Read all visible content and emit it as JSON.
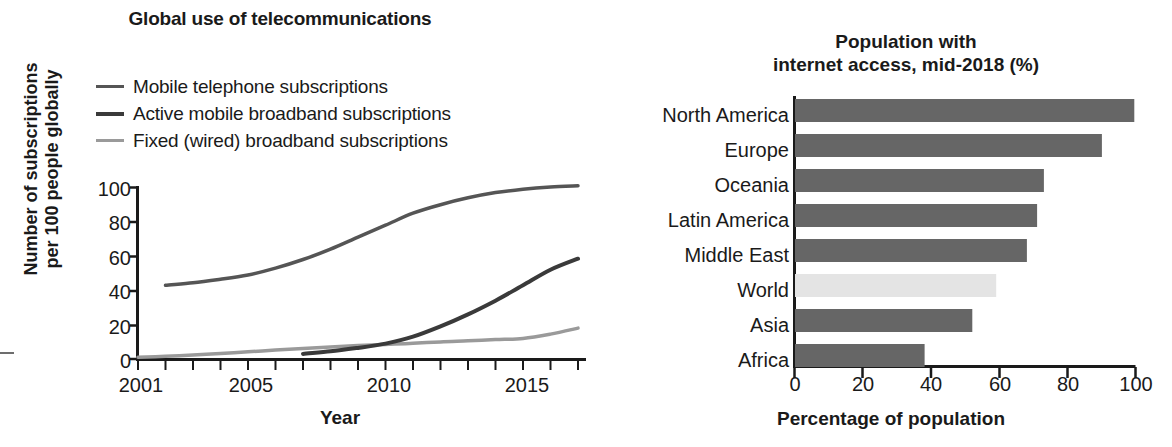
{
  "left_chart": {
    "title": "Global use of telecommunications",
    "ylabel_line1": "Number of subscriptions",
    "ylabel_line2": "per 100 people globally",
    "xlabel": "Year",
    "yticks": [
      "0",
      "20",
      "40",
      "60",
      "80",
      "100"
    ],
    "xticks": [
      "2001",
      "2005",
      "2010",
      "2015"
    ],
    "legend": [
      {
        "label": "Mobile telephone subscriptions",
        "color": "#555555",
        "width": 3
      },
      {
        "label": "Active mobile broadband subscriptions",
        "color": "#3a3a3a",
        "width": 3.5
      },
      {
        "label": "Fixed (wired) broadband subscriptions",
        "color": "#9a9a9a",
        "width": 3
      }
    ]
  },
  "right_chart": {
    "title_line1": "Population with",
    "title_line2": "internet access, mid-2018 (%)",
    "xlabel": "Percentage of population",
    "xticks": [
      "0",
      "20",
      "40",
      "60",
      "80",
      "100"
    ],
    "bar_color": "#666666",
    "highlight_color": "#e4e4e4"
  },
  "chart_data": [
    {
      "type": "line",
      "title": "Global use of telecommunications",
      "xlabel": "Year",
      "ylabel": "Number of subscriptions per 100 people globally",
      "xlim": [
        2001,
        2017
      ],
      "ylim": [
        0,
        100
      ],
      "xticks": [
        2001,
        2005,
        2010,
        2015
      ],
      "yticks": [
        0,
        20,
        40,
        60,
        80,
        100
      ],
      "grid": false,
      "legend_position": "above-plot-left",
      "series": [
        {
          "name": "Mobile telephone subscriptions",
          "color": "#555555",
          "x": [
            2002,
            2003,
            2004,
            2005,
            2006,
            2007,
            2008,
            2009,
            2010,
            2011,
            2012,
            2013,
            2014,
            2015,
            2016,
            2017
          ],
          "values": [
            43,
            44.5,
            46.5,
            49,
            53,
            58,
            64,
            71,
            78,
            85,
            90,
            94,
            97,
            99,
            100.3,
            101
          ]
        },
        {
          "name": "Active mobile broadband subscriptions",
          "color": "#3a3a3a",
          "x": [
            2007,
            2008,
            2009,
            2010,
            2011,
            2012,
            2013,
            2014,
            2015,
            2016,
            2017
          ],
          "values": [
            3,
            4.5,
            6.5,
            9,
            13,
            19,
            26,
            34,
            43,
            52,
            58.5
          ]
        },
        {
          "name": "Fixed (wired) broadband subscriptions",
          "color": "#9a9a9a",
          "x": [
            2001,
            2002,
            2003,
            2004,
            2005,
            2006,
            2007,
            2008,
            2009,
            2010,
            2011,
            2012,
            2013,
            2014,
            2015,
            2016,
            2017
          ],
          "values": [
            1,
            1.6,
            2.3,
            3.2,
            4.2,
            5.2,
            6.1,
            7.0,
            7.8,
            8.5,
            9.2,
            10.0,
            10.6,
            11.3,
            12.0,
            14.5,
            18
          ]
        }
      ]
    },
    {
      "type": "bar",
      "orientation": "horizontal",
      "title": "Population with internet access, mid-2018 (%)",
      "xlabel": "Percentage of population",
      "ylabel": "",
      "xlim": [
        0,
        100
      ],
      "xticks": [
        0,
        20,
        40,
        60,
        80,
        100
      ],
      "grid": false,
      "categories": [
        "North America",
        "Europe",
        "Oceania",
        "Latin America",
        "Middle East",
        "World",
        "Asia",
        "Africa"
      ],
      "values": [
        99.5,
        90,
        73,
        71,
        68,
        59,
        52,
        38
      ],
      "highlighted": [
        "World"
      ]
    }
  ]
}
